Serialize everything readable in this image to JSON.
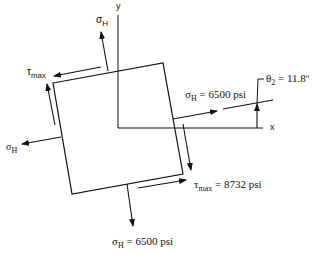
{
  "axes": {
    "x_label": "x",
    "y_label": "y"
  },
  "colors": {
    "line": "#111111",
    "background": "#ffffff"
  },
  "labels": {
    "sigma_top": {
      "symbol": "σ",
      "subscript": "H"
    },
    "tau_top_left": {
      "symbol": "τ",
      "subscript": "max"
    },
    "sigma_left": {
      "symbol": "σ",
      "subscript": "H"
    },
    "sigma_right": {
      "symbol": "σ",
      "subscript": "H",
      "value": "= 6500 psi"
    },
    "theta": {
      "symbol": "θ",
      "subscript": "2",
      "value": "= 11.8",
      "superscript": "o"
    },
    "tau_bottom_right": {
      "symbol": "τ",
      "subscript": "max",
      "value": "= 8732 psi"
    },
    "sigma_bottom": {
      "symbol": "σ",
      "subscript": "H",
      "value": "= 6500 psi"
    }
  },
  "values": {
    "sigma_H_psi": 6500,
    "tau_max_psi": 8732,
    "theta_2_deg": 11.8
  }
}
